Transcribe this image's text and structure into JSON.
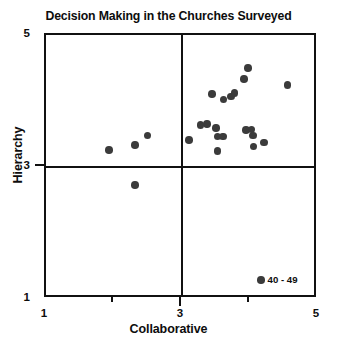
{
  "chart_data": {
    "type": "scatter",
    "title": "Decision Making in the Churches Surveyed",
    "xlabel": "Collaborative",
    "ylabel": "Hierarchy",
    "xlim": [
      1,
      5
    ],
    "ylim": [
      1,
      5
    ],
    "grid": false,
    "xticks": [
      {
        "value": 1,
        "label": "1",
        "major": true
      },
      {
        "value": 2,
        "label": "",
        "major": false
      },
      {
        "value": 3,
        "label": "3",
        "major": true
      },
      {
        "value": 4,
        "label": "",
        "major": false
      },
      {
        "value": 5,
        "label": "5",
        "major": true
      }
    ],
    "yticks": [
      {
        "value": 1,
        "label": "1",
        "major": true
      },
      {
        "value": 3,
        "label": "3",
        "major": true
      },
      {
        "value": 5,
        "label": "5",
        "major": true
      }
    ],
    "reference_lines": {
      "vertical_x": 3,
      "horizontal_y": 3
    },
    "legend": {
      "position": "bottom-right-inside",
      "entries": [
        {
          "name": "40 - 49",
          "marker": "circle",
          "color": "#3b3b3b"
        }
      ]
    },
    "series": [
      {
        "name": "40 - 49",
        "color": "#3b3b3b",
        "marker": "circle",
        "points": [
          {
            "x": 1.93,
            "y": 3.26
          },
          {
            "x": 2.31,
            "y": 3.33
          },
          {
            "x": 2.49,
            "y": 3.48
          },
          {
            "x": 2.31,
            "y": 2.73
          },
          {
            "x": 3.1,
            "y": 3.41
          },
          {
            "x": 3.27,
            "y": 3.64
          },
          {
            "x": 3.37,
            "y": 3.65
          },
          {
            "x": 3.5,
            "y": 3.59
          },
          {
            "x": 3.52,
            "y": 3.46
          },
          {
            "x": 3.6,
            "y": 3.46
          },
          {
            "x": 3.52,
            "y": 3.24
          },
          {
            "x": 3.44,
            "y": 4.11
          },
          {
            "x": 3.61,
            "y": 4.02
          },
          {
            "x": 3.72,
            "y": 4.07
          },
          {
            "x": 3.77,
            "y": 4.12
          },
          {
            "x": 3.91,
            "y": 4.33
          },
          {
            "x": 3.97,
            "y": 4.5
          },
          {
            "x": 3.94,
            "y": 3.56
          },
          {
            "x": 4.02,
            "y": 3.57
          },
          {
            "x": 4.04,
            "y": 3.48
          },
          {
            "x": 4.05,
            "y": 3.31
          },
          {
            "x": 4.21,
            "y": 3.37
          },
          {
            "x": 4.55,
            "y": 4.24
          }
        ]
      }
    ]
  },
  "legend": {
    "label": "40 - 49"
  },
  "axes": {
    "x_title": "Collaborative",
    "y_title": "Hierarchy",
    "x_tick_labels": [
      "1",
      "3",
      "5"
    ],
    "y_tick_labels": [
      "5",
      "3",
      "1"
    ]
  },
  "title": "Decision Making in the Churches Surveyed",
  "colors": {
    "marker": "#3b3b3b",
    "frame": "#111111",
    "text": "#0d0d0d",
    "background": "#ffffff"
  }
}
